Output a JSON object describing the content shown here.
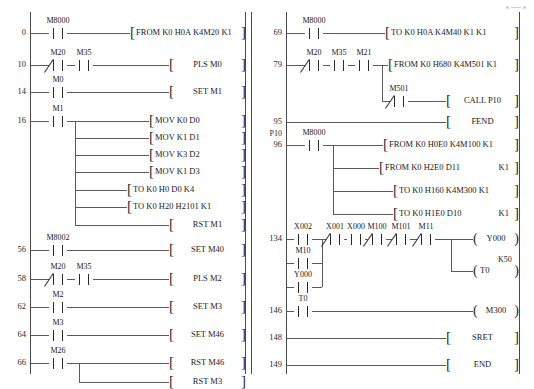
{
  "diagram": {
    "type": "plc-ladder-logic",
    "title": "",
    "columns": [
      {
        "name": "left-column",
        "rungs": [
          {
            "step": "0",
            "contacts": [
              {
                "name": "M8000",
                "type": "NO"
              }
            ],
            "instructions": [
              {
                "text": "FROM  K0  H0A  K4M20  K1"
              }
            ]
          },
          {
            "step": "10",
            "contacts": [
              {
                "name": "M20",
                "type": "NC"
              },
              {
                "name": "M35",
                "type": "NO"
              }
            ],
            "instructions": [
              {
                "text": "PLS  M0"
              }
            ]
          },
          {
            "step": "14",
            "contacts": [
              {
                "name": "M0",
                "type": "NO"
              }
            ],
            "instructions": [
              {
                "text": "SET  M1"
              }
            ]
          },
          {
            "step": "16",
            "contacts": [
              {
                "name": "M1",
                "type": "NO"
              }
            ],
            "instructions": [
              {
                "text": "MOV  K0  D0"
              },
              {
                "text": "MOV  K1  D1"
              },
              {
                "text": "MOV  K3  D2"
              },
              {
                "text": "MOV  K1  D3"
              },
              {
                "text": "TO  K0  H0  D0  K4"
              },
              {
                "text": "TO  K0  H20  H2101  K1"
              },
              {
                "text": "RST  M1"
              }
            ]
          },
          {
            "step": "56",
            "contacts": [
              {
                "name": "M8002",
                "type": "NO"
              }
            ],
            "instructions": [
              {
                "text": "SET  M40"
              }
            ]
          },
          {
            "step": "58",
            "contacts": [
              {
                "name": "M20",
                "type": "NC"
              },
              {
                "name": "M35",
                "type": "NO"
              }
            ],
            "instructions": [
              {
                "text": "PLS  M2"
              }
            ]
          },
          {
            "step": "62",
            "contacts": [
              {
                "name": "M2",
                "type": "NO"
              }
            ],
            "instructions": [
              {
                "text": "SET  M3"
              }
            ]
          },
          {
            "step": "64",
            "contacts": [
              {
                "name": "M3",
                "type": "NO"
              }
            ],
            "instructions": [
              {
                "text": "SET  M46"
              }
            ]
          },
          {
            "step": "66",
            "contacts": [
              {
                "name": "M26",
                "type": "NO"
              }
            ],
            "instructions": [
              {
                "text": "RST  M46"
              },
              {
                "text": "RST  M3"
              }
            ]
          }
        ]
      },
      {
        "name": "right-column",
        "rungs": [
          {
            "step": "69",
            "contacts": [
              {
                "name": "M8000",
                "type": "NO"
              }
            ],
            "instructions": [
              {
                "text": "TO  K0  H0A  K4M40  K1  K1"
              }
            ]
          },
          {
            "step": "79",
            "contacts": [
              {
                "name": "M20",
                "type": "NC"
              },
              {
                "name": "M35",
                "type": "NO"
              },
              {
                "name": "M21",
                "type": "NO"
              }
            ],
            "branch_contact": {
              "name": "M501",
              "type": "NC"
            },
            "instructions": [
              {
                "text": "FROM  K0  H680  K4M501  K1"
              },
              {
                "text": "CALL  P10"
              }
            ]
          },
          {
            "step": "95",
            "contacts": [],
            "instructions": [
              {
                "text": "FEND"
              }
            ]
          },
          {
            "step": "96",
            "label": "P10",
            "contacts": [
              {
                "name": "M8000",
                "type": "NO"
              }
            ],
            "instructions": [
              {
                "text": "FROM  K0  H0E0  K4M100  K1"
              },
              {
                "text": "FROM  K0  H2E0  D11",
                "tail": "K1"
              },
              {
                "text": "TO  K0  H160  K4M300  K1"
              },
              {
                "text": "TO  K0  H1E0  D10",
                "tail": "K1"
              }
            ]
          },
          {
            "step": "134",
            "contacts": [
              {
                "name": "X002",
                "type": "NO"
              },
              {
                "name": "X001",
                "type": "NC"
              },
              {
                "name": "X000",
                "type": "NO"
              },
              {
                "name": "M100",
                "type": "NC"
              },
              {
                "name": "M101",
                "type": "NC"
              },
              {
                "name": "M11",
                "type": "NC"
              }
            ],
            "parallel_contacts": [
              {
                "name": "M10",
                "type": "NO"
              },
              {
                "name": "Y000",
                "type": "NO"
              }
            ],
            "coils": [
              {
                "name": "Y000",
                "preset": ""
              },
              {
                "name": "T0",
                "preset": "K50"
              }
            ]
          },
          {
            "step": "146",
            "contacts": [
              {
                "name": "T0",
                "type": "NO"
              }
            ],
            "coils": [
              {
                "name": "M300",
                "preset": ""
              }
            ]
          },
          {
            "step": "148",
            "contacts": [],
            "instructions": [
              {
                "text": "SRET"
              }
            ]
          },
          {
            "step": "149",
            "contacts": [],
            "instructions": [
              {
                "text": "END"
              }
            ]
          }
        ]
      }
    ]
  },
  "colors": {
    "rail": "#4a4a4a",
    "wire": "#5a5a5a",
    "ink": "#2c2c2c",
    "background": "#ffffff"
  }
}
